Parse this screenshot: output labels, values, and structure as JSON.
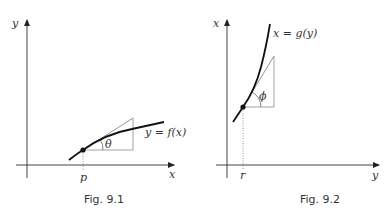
{
  "figures": [
    {
      "id": "fig-9-1",
      "caption": "Fig. 9.1",
      "axes": {
        "vertical_label": "y",
        "horizontal_label": "x"
      },
      "curve_label": "y = f(x)",
      "point_label": "p",
      "angle_label": "θ",
      "description": "Concave increasing curve y = f(x) with tangent line at point p forming angle θ with the horizontal"
    },
    {
      "id": "fig-9-2",
      "caption": "Fig. 9.2",
      "axes": {
        "vertical_label": "x",
        "horizontal_label": "y"
      },
      "curve_label": "x = g(y)",
      "point_label": "r",
      "angle_label": "ϕ",
      "description": "Convex increasing curve x = g(y) with tangent line at point r forming angle ϕ with the horizontal"
    }
  ],
  "colors": {
    "axis": "#333333",
    "curve": "#111111",
    "construction": "#999999"
  }
}
